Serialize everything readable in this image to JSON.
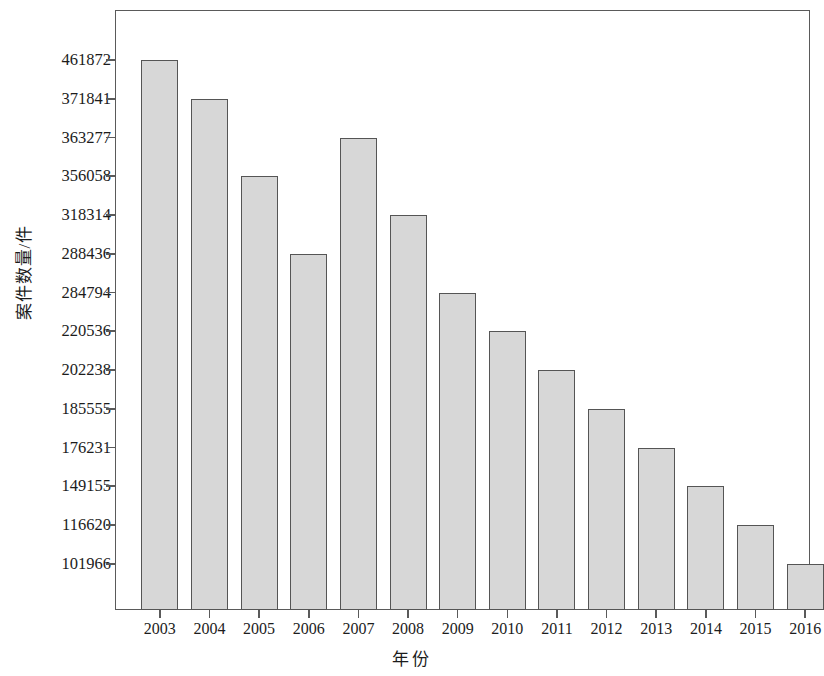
{
  "chart_data": {
    "type": "bar",
    "title": "",
    "xlabel": "年份",
    "ylabel": "案件数量/件",
    "categories": [
      "2003",
      "2004",
      "2005",
      "2006",
      "2007",
      "2008",
      "2009",
      "2010",
      "2011",
      "2012",
      "2013",
      "2014",
      "2015",
      "2016"
    ],
    "values": [
      461872,
      371841,
      356058,
      288436,
      363277,
      318314,
      284794,
      220536,
      202238,
      185555,
      176231,
      149155,
      116620,
      101966
    ],
    "y_tick_labels": [
      "461872",
      "371841",
      "363277",
      "356058",
      "318314",
      "288436",
      "284794",
      "220536",
      "202238",
      "185555",
      "176231",
      "149155",
      "116620",
      "101966"
    ],
    "y_axis_note": "Tick labels are the sorted data values placed at equal vertical intervals (ordinal-style axis)",
    "grid": false,
    "legend": false,
    "bar_fill_color": "#d7d7d7",
    "bar_border_color": "#555555",
    "axis_color": "#5a5a5a",
    "background_color": "#ffffff"
  },
  "axes": {
    "y_title": "案件数量/件",
    "x_title": "年份"
  }
}
